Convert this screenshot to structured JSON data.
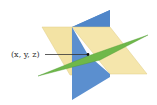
{
  "diagram": {
    "point_label": "(x, y, z)",
    "colors": {
      "yellow_plane": "#f3e3a4",
      "yellow_edge": "#c9b46a",
      "blue_plane": "#5b8fcf",
      "blue_plane_dark": "#3f73b6",
      "green_plane": "#6fb84a",
      "pointer": "#333333"
    }
  }
}
